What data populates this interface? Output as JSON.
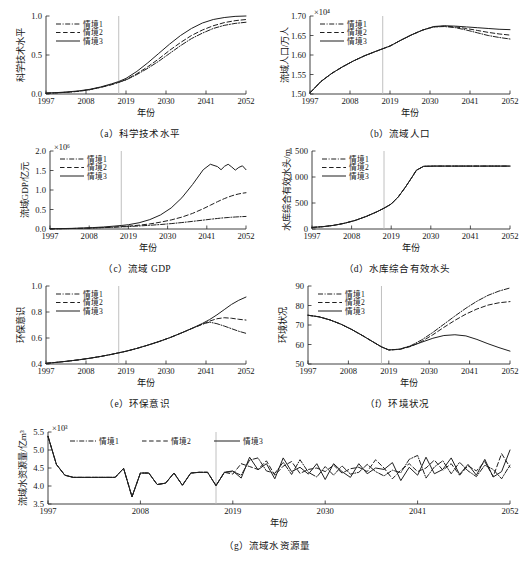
{
  "figure": {
    "background": "#ffffff",
    "line_color": "#1f1f1f",
    "divider_color": "#b9b9b9",
    "divider_year": 2017,
    "xlabel": "年份",
    "xticks": [
      "1997",
      "2008",
      "2019",
      "2030",
      "2041",
      "2052"
    ],
    "xlim": [
      1997,
      2052
    ],
    "legend_labels": [
      "情境1",
      "情境2",
      "情境3"
    ]
  },
  "chart_data": [
    {
      "id": "a",
      "type": "line",
      "caption": "（a）科学技术水平",
      "title": "科学技术水平",
      "xlabel": "年份",
      "ylabel": "科学技术水平",
      "exponent": "",
      "xlim": [
        1997,
        2052
      ],
      "ylim": [
        0.0,
        1.0
      ],
      "yticks": [
        "0.0",
        "0.5",
        "1.0"
      ],
      "ytickvals": [
        0.0,
        0.5,
        1.0
      ],
      "grid": false,
      "legend_position": "upper-left",
      "x": [
        1997,
        2000,
        2003,
        2006,
        2009,
        2012,
        2015,
        2017,
        2019,
        2022,
        2025,
        2028,
        2031,
        2034,
        2037,
        2040,
        2043,
        2046,
        2049,
        2052
      ],
      "series": [
        {
          "name": "情境1",
          "style": "dashdot",
          "values": [
            0.01,
            0.015,
            0.023,
            0.035,
            0.055,
            0.085,
            0.12,
            0.15,
            0.18,
            0.25,
            0.33,
            0.42,
            0.52,
            0.62,
            0.71,
            0.78,
            0.84,
            0.88,
            0.905,
            0.92
          ]
        },
        {
          "name": "情境2",
          "style": "dashed",
          "values": [
            0.01,
            0.015,
            0.023,
            0.035,
            0.055,
            0.085,
            0.12,
            0.15,
            0.185,
            0.26,
            0.35,
            0.45,
            0.56,
            0.66,
            0.75,
            0.82,
            0.875,
            0.915,
            0.94,
            0.955
          ]
        },
        {
          "name": "情境3",
          "style": "solid",
          "values": [
            0.012,
            0.018,
            0.027,
            0.04,
            0.06,
            0.09,
            0.13,
            0.16,
            0.2,
            0.29,
            0.4,
            0.52,
            0.64,
            0.75,
            0.84,
            0.91,
            0.955,
            0.98,
            0.995,
            1.0
          ]
        }
      ]
    },
    {
      "id": "b",
      "type": "line",
      "caption": "（b）流域人口",
      "title": "流域人口",
      "xlabel": "年份",
      "ylabel": "流域人口/万人",
      "exponent": "×10⁴",
      "xlim": [
        1997,
        2052
      ],
      "ylim": [
        1.5,
        1.7
      ],
      "yticks": [
        "1.50",
        "1.55",
        "1.60",
        "1.65",
        "1.70"
      ],
      "ytickvals": [
        1.5,
        1.55,
        1.6,
        1.65,
        1.7
      ],
      "grid": false,
      "legend_position": "upper-left",
      "x": [
        1997,
        2000,
        2003,
        2006,
        2009,
        2012,
        2015,
        2017,
        2019,
        2022,
        2025,
        2028,
        2031,
        2034,
        2037,
        2040,
        2043,
        2046,
        2049,
        2052
      ],
      "series": [
        {
          "name": "情境1",
          "style": "dashdot",
          "values": [
            1.503,
            1.532,
            1.553,
            1.57,
            1.585,
            1.598,
            1.609,
            1.616,
            1.623,
            1.638,
            1.652,
            1.664,
            1.672,
            1.673,
            1.67,
            1.664,
            1.657,
            1.65,
            1.645,
            1.641
          ]
        },
        {
          "name": "情境2",
          "style": "dashed",
          "values": [
            1.503,
            1.532,
            1.553,
            1.57,
            1.585,
            1.598,
            1.609,
            1.616,
            1.623,
            1.638,
            1.652,
            1.664,
            1.672,
            1.674,
            1.672,
            1.668,
            1.663,
            1.658,
            1.654,
            1.651
          ]
        },
        {
          "name": "情境3",
          "style": "solid",
          "values": [
            1.503,
            1.532,
            1.553,
            1.57,
            1.585,
            1.598,
            1.609,
            1.616,
            1.623,
            1.638,
            1.652,
            1.664,
            1.673,
            1.675,
            1.674,
            1.672,
            1.67,
            1.668,
            1.666,
            1.665
          ]
        }
      ]
    },
    {
      "id": "c",
      "type": "line",
      "caption": "（c）流域 GDP",
      "title": "流域 GDP",
      "xlabel": "年份",
      "ylabel": "流域GDP/亿元",
      "exponent": "×10⁶",
      "xlim": [
        1997,
        2052
      ],
      "ylim": [
        0.0,
        2.0
      ],
      "yticks": [
        "0.0",
        "0.5",
        "1.0",
        "1.5",
        "2.0"
      ],
      "ytickvals": [
        0.0,
        0.5,
        1.0,
        1.5,
        2.0
      ],
      "grid": false,
      "legend_position": "upper-left",
      "x": [
        1997,
        2000,
        2003,
        2006,
        2009,
        2012,
        2015,
        2017,
        2019,
        2022,
        2025,
        2028,
        2031,
        2034,
        2037,
        2040,
        2042,
        2044,
        2045,
        2046,
        2047,
        2048,
        2049,
        2050,
        2051,
        2052
      ],
      "series": [
        {
          "name": "情境1",
          "style": "dashdot",
          "values": [
            0.005,
            0.008,
            0.012,
            0.018,
            0.026,
            0.035,
            0.046,
            0.054,
            0.062,
            0.078,
            0.095,
            0.115,
            0.138,
            0.165,
            0.196,
            0.228,
            0.25,
            0.27,
            0.28,
            0.288,
            0.295,
            0.302,
            0.308,
            0.313,
            0.318,
            0.322
          ]
        },
        {
          "name": "情境2",
          "style": "dashed",
          "values": [
            0.005,
            0.008,
            0.012,
            0.018,
            0.027,
            0.038,
            0.052,
            0.062,
            0.074,
            0.098,
            0.13,
            0.175,
            0.232,
            0.305,
            0.4,
            0.52,
            0.61,
            0.7,
            0.742,
            0.782,
            0.818,
            0.85,
            0.878,
            0.9,
            0.918,
            0.93
          ]
        },
        {
          "name": "情境3",
          "style": "solid",
          "values": [
            0.006,
            0.01,
            0.016,
            0.024,
            0.036,
            0.052,
            0.074,
            0.09,
            0.11,
            0.16,
            0.24,
            0.36,
            0.54,
            0.8,
            1.14,
            1.52,
            1.66,
            1.6,
            1.52,
            1.61,
            1.66,
            1.59,
            1.51,
            1.58,
            1.62,
            1.52
          ]
        }
      ]
    },
    {
      "id": "d",
      "type": "line",
      "caption": "（d）水库综合有效水头",
      "title": "水库综合有效水头",
      "xlabel": "年份",
      "ylabel": "水库综合有效水头/m",
      "exponent": "",
      "xlim": [
        1997,
        2052
      ],
      "ylim": [
        0,
        1500
      ],
      "yticks": [
        "0",
        "500",
        "1 000",
        "1 500"
      ],
      "ytickvals": [
        0,
        500,
        1000,
        1500
      ],
      "grid": false,
      "legend_position": "upper-left",
      "x": [
        1997,
        2000,
        2003,
        2006,
        2009,
        2012,
        2015,
        2017,
        2019,
        2021,
        2023,
        2025,
        2026,
        2028,
        2031,
        2034,
        2037,
        2040,
        2043,
        2046,
        2049,
        2052
      ],
      "series": [
        {
          "name": "情境1",
          "style": "dashdot",
          "values": [
            30,
            45,
            70,
            110,
            165,
            240,
            330,
            400,
            480,
            620,
            810,
            1020,
            1130,
            1205,
            1210,
            1210,
            1210,
            1210,
            1210,
            1210,
            1210,
            1210
          ]
        },
        {
          "name": "情境2",
          "style": "dashed",
          "values": [
            30,
            45,
            70,
            110,
            165,
            240,
            330,
            400,
            480,
            620,
            810,
            1020,
            1130,
            1205,
            1210,
            1210,
            1210,
            1210,
            1210,
            1210,
            1210,
            1210
          ]
        },
        {
          "name": "情境3",
          "style": "solid",
          "values": [
            30,
            45,
            70,
            110,
            165,
            240,
            330,
            400,
            480,
            620,
            810,
            1020,
            1130,
            1205,
            1210,
            1210,
            1210,
            1210,
            1210,
            1210,
            1210,
            1210
          ]
        }
      ]
    },
    {
      "id": "e",
      "type": "line",
      "caption": "（e）环保意识",
      "title": "环保意识",
      "xlabel": "年份",
      "ylabel": "环保意识",
      "exponent": "",
      "xlim": [
        1997,
        2052
      ],
      "ylim": [
        0.4,
        1.0
      ],
      "yticks": [
        "0.4",
        "0.6",
        "0.8",
        "1.0"
      ],
      "ytickvals": [
        0.4,
        0.6,
        0.8,
        1.0
      ],
      "grid": false,
      "legend_position": "upper-left",
      "x": [
        1997,
        2000,
        2003,
        2006,
        2009,
        2012,
        2015,
        2017,
        2019,
        2022,
        2025,
        2028,
        2031,
        2034,
        2037,
        2040,
        2042,
        2044,
        2046,
        2048,
        2050,
        2052
      ],
      "series": [
        {
          "name": "情境1",
          "style": "dashdot",
          "values": [
            0.405,
            0.413,
            0.422,
            0.432,
            0.444,
            0.458,
            0.474,
            0.486,
            0.498,
            0.52,
            0.545,
            0.572,
            0.602,
            0.636,
            0.672,
            0.706,
            0.722,
            0.71,
            0.692,
            0.672,
            0.652,
            0.636
          ]
        },
        {
          "name": "情境2",
          "style": "dashed",
          "values": [
            0.405,
            0.413,
            0.422,
            0.432,
            0.444,
            0.458,
            0.474,
            0.486,
            0.498,
            0.52,
            0.545,
            0.572,
            0.602,
            0.636,
            0.672,
            0.706,
            0.73,
            0.748,
            0.756,
            0.752,
            0.744,
            0.738
          ]
        },
        {
          "name": "情境3",
          "style": "solid",
          "values": [
            0.405,
            0.413,
            0.422,
            0.432,
            0.444,
            0.458,
            0.474,
            0.486,
            0.498,
            0.52,
            0.545,
            0.572,
            0.602,
            0.636,
            0.672,
            0.712,
            0.742,
            0.778,
            0.818,
            0.858,
            0.89,
            0.915
          ]
        }
      ]
    },
    {
      "id": "f",
      "type": "line",
      "caption": "（f）环境状况",
      "title": "环境状况",
      "xlabel": "年份",
      "ylabel": "环境状况",
      "exponent": "",
      "xlim": [
        1997,
        2052
      ],
      "ylim": [
        50,
        90
      ],
      "yticks": [
        "50",
        "60",
        "70",
        "80",
        "90"
      ],
      "ytickvals": [
        50,
        60,
        70,
        80,
        90
      ],
      "grid": false,
      "legend_position": "upper-left",
      "x": [
        1997,
        2000,
        2003,
        2006,
        2009,
        2012,
        2015,
        2017,
        2019,
        2022,
        2025,
        2028,
        2031,
        2034,
        2037,
        2040,
        2043,
        2046,
        2049,
        2052
      ],
      "series": [
        {
          "name": "情境1",
          "style": "dashdot",
          "values": [
            75.0,
            74.2,
            72.6,
            70.4,
            67.6,
            64.4,
            61.0,
            58.8,
            57.2,
            57.6,
            59.4,
            62.4,
            66.2,
            70.4,
            74.6,
            78.6,
            82.2,
            85.2,
            87.4,
            89.0
          ]
        },
        {
          "name": "情境2",
          "style": "dashed",
          "values": [
            75.0,
            74.2,
            72.6,
            70.4,
            67.6,
            64.4,
            61.0,
            58.8,
            57.2,
            57.5,
            59.0,
            61.6,
            65.0,
            68.8,
            72.4,
            75.6,
            78.2,
            80.2,
            81.4,
            82.0
          ]
        },
        {
          "name": "情境3",
          "style": "solid",
          "values": [
            75.0,
            74.2,
            72.6,
            70.4,
            67.6,
            64.4,
            61.0,
            58.8,
            57.2,
            57.6,
            59.2,
            61.2,
            63.2,
            64.6,
            65.0,
            64.4,
            62.6,
            60.4,
            58.4,
            56.6
          ]
        }
      ]
    },
    {
      "id": "g",
      "type": "line",
      "caption": "（g）流域水资源量",
      "title": "流域水资源量",
      "xlabel": "年份",
      "ylabel": "流域水资源量/亿m³",
      "exponent": "×10³",
      "xlim": [
        1997,
        2052
      ],
      "ylim": [
        3.5,
        5.5
      ],
      "yticks": [
        "3.5",
        "4.0",
        "4.5",
        "5.0",
        "5.5"
      ],
      "ytickvals": [
        3.5,
        4.0,
        4.5,
        5.0,
        5.5
      ],
      "grid": false,
      "legend_position": "upper-horizontal",
      "x": [
        1997,
        1998,
        1999,
        2000,
        2001,
        2002,
        2003,
        2004,
        2005,
        2006,
        2007,
        2008,
        2009,
        2010,
        2011,
        2012,
        2013,
        2014,
        2015,
        2016,
        2017,
        2018,
        2019,
        2020,
        2021,
        2022,
        2023,
        2024,
        2025,
        2026,
        2027,
        2028,
        2029,
        2030,
        2031,
        2032,
        2033,
        2034,
        2035,
        2036,
        2037,
        2038,
        2039,
        2040,
        2041,
        2042,
        2043,
        2044,
        2045,
        2046,
        2047,
        2048,
        2049,
        2050,
        2051,
        2052
      ],
      "series": [
        {
          "name": "情境1",
          "style": "dashdot",
          "values": [
            5.38,
            4.6,
            4.3,
            4.24,
            4.24,
            4.24,
            4.24,
            4.24,
            4.24,
            4.49,
            3.7,
            4.36,
            4.36,
            4.04,
            4.08,
            4.36,
            4.02,
            4.36,
            4.38,
            4.38,
            4.01,
            4.38,
            4.4,
            4.3,
            4.72,
            4.78,
            4.42,
            4.35,
            4.66,
            4.32,
            4.73,
            4.38,
            4.25,
            4.54,
            4.3,
            4.56,
            4.33,
            4.38,
            4.6,
            4.4,
            4.28,
            4.44,
            4.37,
            4.74,
            4.85,
            4.22,
            4.53,
            4.7,
            4.34,
            4.66,
            4.42,
            4.26,
            4.58,
            4.46,
            4.2,
            4.58
          ]
        },
        {
          "name": "情境2",
          "style": "dashed",
          "values": [
            5.38,
            4.6,
            4.3,
            4.24,
            4.24,
            4.24,
            4.24,
            4.24,
            4.24,
            4.49,
            3.7,
            4.36,
            4.36,
            4.04,
            4.08,
            4.36,
            4.02,
            4.36,
            4.38,
            4.38,
            4.01,
            4.38,
            4.33,
            4.62,
            4.54,
            4.46,
            4.7,
            4.3,
            4.55,
            4.68,
            4.35,
            4.46,
            4.5,
            4.4,
            4.58,
            4.36,
            4.48,
            4.52,
            4.4,
            4.73,
            4.5,
            4.2,
            4.44,
            4.62,
            4.4,
            4.5,
            4.72,
            4.44,
            4.62,
            4.3,
            4.56,
            4.42,
            4.68,
            4.26,
            4.9,
            4.52
          ]
        },
        {
          "name": "情境3",
          "style": "solid",
          "values": [
            5.38,
            4.6,
            4.3,
            4.24,
            4.24,
            4.24,
            4.24,
            4.24,
            4.24,
            4.49,
            3.7,
            4.36,
            4.36,
            4.04,
            4.08,
            4.36,
            4.02,
            4.36,
            4.38,
            4.38,
            4.01,
            4.38,
            4.42,
            4.22,
            4.8,
            4.45,
            4.62,
            4.2,
            4.78,
            4.4,
            4.52,
            4.33,
            4.62,
            4.18,
            4.62,
            4.4,
            4.24,
            4.62,
            4.34,
            4.5,
            4.46,
            4.65,
            4.15,
            4.52,
            4.3,
            4.8,
            4.34,
            4.46,
            4.78,
            4.32,
            4.6,
            4.3,
            4.74,
            4.25,
            4.4,
            5.0
          ]
        }
      ]
    }
  ]
}
